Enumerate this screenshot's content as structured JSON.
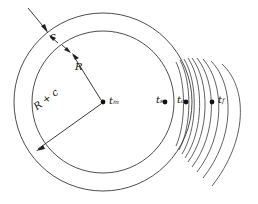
{
  "figure": {
    "type": "engineering-cross-section-diagram",
    "background_color": "#ffffff",
    "line_color": "#3a3a3a"
  },
  "geometry": {
    "center": {
      "x": 103,
      "y": 102
    },
    "outer_circle": {
      "cx": 103,
      "cy": 102,
      "r": 89
    },
    "inner_circle": {
      "cx": 103,
      "cy": 102,
      "r": 71
    }
  },
  "dimension_labels": {
    "wall_thickness": {
      "symbol": "c",
      "text": "c"
    },
    "inner_radius": {
      "symbol": "R",
      "text": "R"
    },
    "outer_radius": {
      "symbol": "R + c",
      "text": "R + c"
    }
  },
  "temperature_points": [
    {
      "id": "t-m",
      "label": "t",
      "sub": "m",
      "x": 103,
      "y": 102,
      "meaning": "mean temperature at center"
    },
    {
      "id": "t-s",
      "label": "t",
      "sub": "s",
      "x": 165,
      "y": 102,
      "meaning": "inner surface temperature"
    },
    {
      "id": "t-c",
      "label": "t",
      "sub": "c",
      "x": 186,
      "y": 102,
      "meaning": "outer wall surface temperature"
    },
    {
      "id": "t-f",
      "label": "t",
      "sub": "f",
      "x": 212,
      "y": 102,
      "meaning": "fluid temperature"
    }
  ],
  "boundary_layer": {
    "description": "family of nested arcs fanning outward to the right of the tube wall",
    "arc_count": 9
  }
}
